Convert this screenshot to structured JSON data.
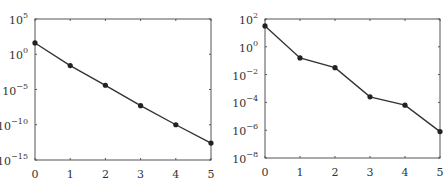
{
  "chart_data": [
    {
      "type": "line",
      "title": "",
      "xlabel": "",
      "ylabel": "",
      "yscale": "log",
      "x": [
        0,
        1,
        2,
        3,
        4,
        5
      ],
      "values": [
        40,
        0.025,
        4e-05,
        5e-08,
        1e-10,
        2.5e-13
      ],
      "log10_values": [
        1.6,
        -1.6,
        -4.4,
        -7.3,
        -10.0,
        -12.6
      ],
      "xlim": [
        0,
        5
      ],
      "ylim_exp": [
        -15,
        5
      ],
      "xticks": [
        "0",
        "1",
        "2",
        "3",
        "4",
        "5"
      ],
      "yticks": [
        {
          "base": "10",
          "exp": "5",
          "e": 5
        },
        {
          "base": "10",
          "exp": "0",
          "e": 0
        },
        {
          "base": "10",
          "exp": "−5",
          "e": -5
        },
        {
          "base": "10",
          "exp": "−10",
          "e": -10
        },
        {
          "base": "10",
          "exp": "−15",
          "e": -15
        }
      ],
      "grid": false,
      "marker": "circle",
      "line_color": "#333333"
    },
    {
      "type": "line",
      "title": "",
      "xlabel": "",
      "ylabel": "",
      "yscale": "log",
      "x": [
        0,
        1,
        2,
        3,
        4,
        5
      ],
      "values": [
        30,
        0.16,
        0.03,
        0.00025,
        6e-05,
        8e-07
      ],
      "log10_values": [
        1.5,
        -0.8,
        -1.5,
        -3.6,
        -4.2,
        -6.1
      ],
      "xlim": [
        0,
        5
      ],
      "ylim_exp": [
        -8,
        2
      ],
      "xticks": [
        "0",
        "1",
        "2",
        "3",
        "4",
        "5"
      ],
      "yticks": [
        {
          "base": "10",
          "exp": "2",
          "e": 2
        },
        {
          "base": "10",
          "exp": "0",
          "e": 0
        },
        {
          "base": "10",
          "exp": "−2",
          "e": -2
        },
        {
          "base": "10",
          "exp": "−4",
          "e": -4
        },
        {
          "base": "10",
          "exp": "−6",
          "e": -6
        },
        {
          "base": "10",
          "exp": "−8",
          "e": -8
        }
      ],
      "grid": false,
      "marker": "circle",
      "line_color": "#333333"
    }
  ]
}
